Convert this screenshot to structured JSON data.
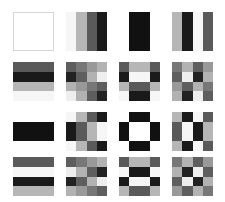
{
  "layout": {
    "rows": 4,
    "cols": 4,
    "col_x": [
      13,
      66,
      119,
      172
    ],
    "row_y": [
      12,
      62,
      112,
      157
    ],
    "cell_w": 41,
    "cell_h": 39
  },
  "basis_1d": {
    "horizontal": [
      [
        1,
        1,
        1,
        1
      ],
      [
        0.924,
        0.383,
        -0.383,
        -0.924
      ],
      [
        1,
        -1,
        -1,
        1
      ],
      [
        0.383,
        -0.924,
        0.924,
        -0.383
      ]
    ],
    "vertical": [
      [
        1,
        1,
        1,
        1
      ],
      [
        -0.383,
        -0.924,
        0.383,
        0.924
      ],
      [
        1,
        -1,
        -1,
        1
      ],
      [
        -0.383,
        0.924,
        -0.924,
        0.383
      ]
    ]
  },
  "colors": {
    "background": "#ffffff",
    "outline": "#d6d6d6",
    "white": "#ffffff",
    "black": "#111111"
  }
}
